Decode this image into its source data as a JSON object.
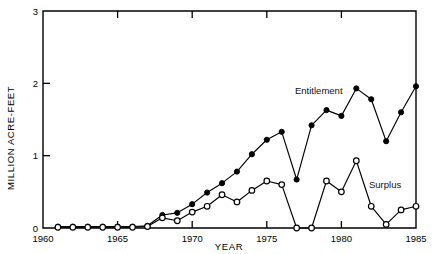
{
  "chart_data": {
    "type": "line",
    "title": "",
    "xlabel": "YEAR",
    "ylabel": "MILLION ACRE-FEET",
    "xlim": [
      1960,
      1985
    ],
    "ylim": [
      0,
      3
    ],
    "xticks": [
      1960,
      1965,
      1970,
      1975,
      1980,
      1985
    ],
    "xticklabels": [
      "1960",
      "1965",
      "1970",
      "1975",
      "1980",
      "1985"
    ],
    "yticks": [
      0,
      1,
      2,
      3
    ],
    "yticklabels": [
      "0",
      "1",
      "2",
      "3"
    ],
    "grid": false,
    "legend_position": "inline-annotations",
    "x": [
      1961,
      1962,
      1963,
      1964,
      1965,
      1966,
      1967,
      1968,
      1969,
      1970,
      1971,
      1972,
      1973,
      1974,
      1975,
      1976,
      1977,
      1978,
      1979,
      1980,
      1981,
      1982,
      1983,
      1984,
      1985
    ],
    "series": [
      {
        "name": "Entitlement",
        "marker": "filled-circle",
        "values": [
          0.02,
          0.02,
          0.02,
          0.02,
          0.02,
          0.02,
          0.03,
          0.18,
          0.21,
          0.33,
          0.49,
          0.62,
          0.78,
          1.02,
          1.22,
          1.33,
          0.67,
          1.42,
          1.63,
          1.55,
          1.93,
          1.78,
          1.2,
          1.6,
          1.96
        ],
        "annotation": "Entitlement"
      },
      {
        "name": "Surplus",
        "marker": "open-circle",
        "values": [
          0.01,
          0.01,
          0.01,
          0.01,
          0.01,
          0.01,
          0.02,
          0.14,
          0.1,
          0.22,
          0.3,
          0.46,
          0.36,
          0.52,
          0.65,
          0.6,
          0.0,
          0.0,
          0.65,
          0.5,
          0.93,
          0.3,
          0.05,
          0.25,
          0.3
        ],
        "annotation": "Surplus"
      }
    ]
  },
  "annotations": {
    "entitlement_label": "Entitlement",
    "surplus_label": "Surplus"
  }
}
